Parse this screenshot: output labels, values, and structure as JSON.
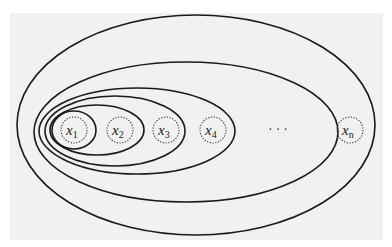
{
  "diagram": {
    "type": "nested-sets",
    "elements": [
      {
        "base": "x",
        "sub": "1"
      },
      {
        "base": "x",
        "sub": "2"
      },
      {
        "base": "x",
        "sub": "3"
      },
      {
        "base": "x",
        "sub": "4"
      },
      {
        "base": "x",
        "sub": "n"
      }
    ],
    "ellipsis": "···",
    "colors": {
      "background": "#f1f1f1",
      "stroke": "#1a1a1a"
    }
  }
}
